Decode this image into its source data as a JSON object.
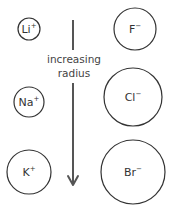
{
  "diagram": {
    "arrow": {
      "label_line1": "increasing",
      "label_line2": "radius",
      "direction": "down",
      "color": "#555555"
    },
    "cations": [
      {
        "symbol": "Li",
        "charge": "+",
        "cx": 29,
        "cy": 29,
        "r": 11
      },
      {
        "symbol": "Na",
        "charge": "+",
        "cx": 29,
        "cy": 102,
        "r": 15
      },
      {
        "symbol": "K",
        "charge": "+",
        "cx": 29,
        "cy": 172,
        "r": 22
      }
    ],
    "anions": [
      {
        "symbol": "F",
        "charge": "−",
        "cx": 135,
        "cy": 29,
        "r": 21
      },
      {
        "symbol": "Cl",
        "charge": "−",
        "cx": 133,
        "cy": 97,
        "r": 29
      },
      {
        "symbol": "Br",
        "charge": "−",
        "cx": 133,
        "cy": 172,
        "r": 32
      }
    ],
    "stroke_color": "#333333",
    "background": "#ffffff"
  }
}
